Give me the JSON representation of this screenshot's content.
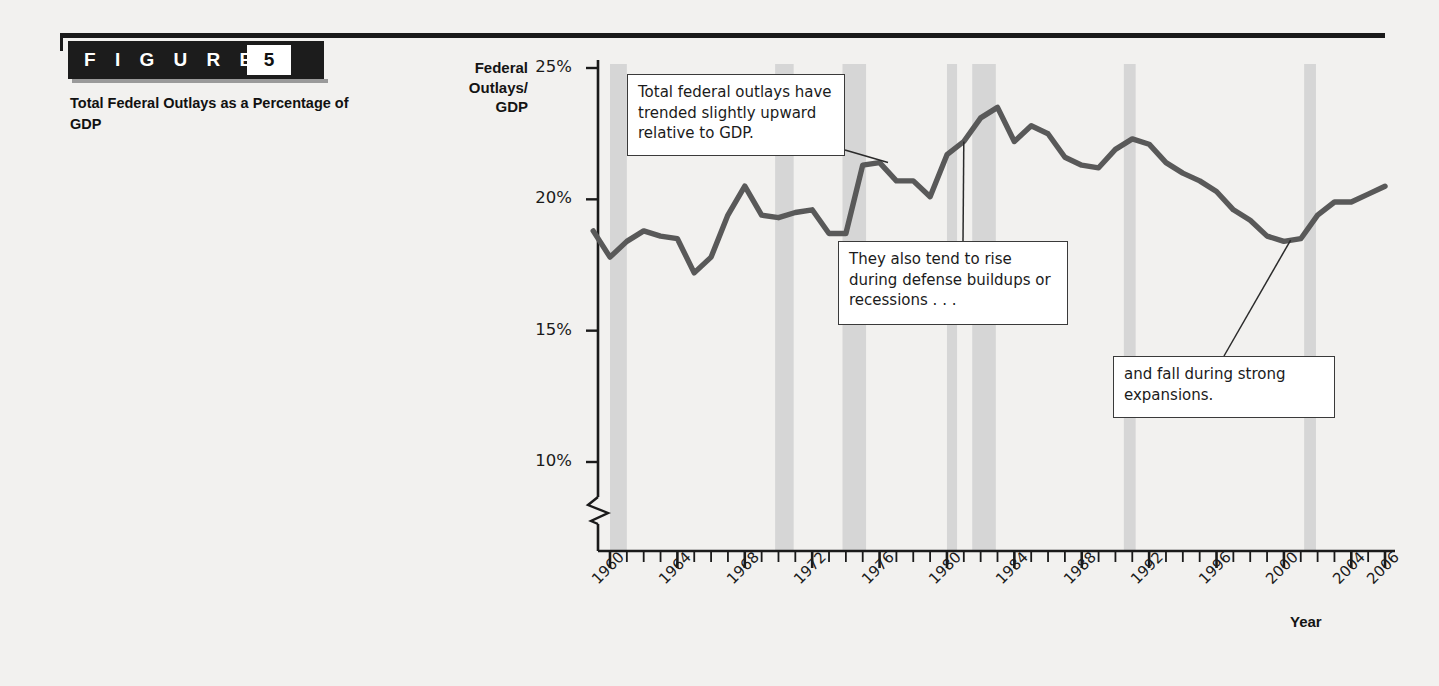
{
  "figure": {
    "word": "F I G U R E",
    "number": "5",
    "caption": "Total Federal Outlays as a Percentage of GDP"
  },
  "chart_data": {
    "type": "line",
    "title": "Total Federal Outlays as a Percentage of GDP",
    "xlabel": "Year",
    "ylabel": "Federal Outlays/ GDP",
    "ylabel_lines": [
      "Federal",
      "Outlays/",
      "GDP"
    ],
    "xlim": [
      1959,
      2007
    ],
    "ylim": [
      9,
      25
    ],
    "y_axis_break": true,
    "grid": false,
    "legend": "none",
    "line_color": "#595959",
    "recession_band_color": "#d6d6d6",
    "yticks": [
      10,
      15,
      20,
      25
    ],
    "ytick_labels": [
      "10%",
      "15%",
      "20%",
      "25%"
    ],
    "xticks": [
      1960,
      1964,
      1968,
      1972,
      1976,
      1980,
      1984,
      1988,
      1992,
      1996,
      2000,
      2004,
      2006
    ],
    "xtick_labels": [
      "1960",
      "1964",
      "1968",
      "1972",
      "1976",
      "1980",
      "1984",
      "1988",
      "1992",
      "1996",
      "2000",
      "2004",
      "2006"
    ],
    "x": [
      1959,
      1960,
      1961,
      1962,
      1963,
      1964,
      1965,
      1966,
      1967,
      1968,
      1969,
      1970,
      1971,
      1972,
      1973,
      1974,
      1975,
      1976,
      1977,
      1978,
      1979,
      1980,
      1981,
      1982,
      1983,
      1984,
      1985,
      1986,
      1987,
      1988,
      1989,
      1990,
      1991,
      1992,
      1993,
      1994,
      1995,
      1996,
      1997,
      1998,
      1999,
      2000,
      2001,
      2002,
      2003,
      2004,
      2005,
      2006
    ],
    "values": [
      18.8,
      17.8,
      18.4,
      18.8,
      18.6,
      18.5,
      17.2,
      17.8,
      19.4,
      20.5,
      19.4,
      19.3,
      19.5,
      19.6,
      18.7,
      18.7,
      21.3,
      21.4,
      20.7,
      20.7,
      20.1,
      21.7,
      22.2,
      23.1,
      23.5,
      22.2,
      22.8,
      22.5,
      21.6,
      21.3,
      21.2,
      21.9,
      22.3,
      22.1,
      21.4,
      21.0,
      20.7,
      20.3,
      19.6,
      19.2,
      18.6,
      18.4,
      18.5,
      19.4,
      19.9,
      19.9,
      20.2,
      20.5
    ],
    "recession_bands": [
      {
        "start": 1960.0,
        "end": 1961.0
      },
      {
        "start": 1969.8,
        "end": 1970.9
      },
      {
        "start": 1973.8,
        "end": 1975.2
      },
      {
        "start": 1980.0,
        "end": 1980.6
      },
      {
        "start": 1981.5,
        "end": 1982.9
      },
      {
        "start": 1990.5,
        "end": 1991.2
      },
      {
        "start": 2001.2,
        "end": 2001.9
      }
    ],
    "annotations": [
      {
        "text": "Total federal outlays have trended slightly upward relative to GDP.",
        "target_x": 1976.5,
        "target_y": 21.4
      },
      {
        "text": "They also tend to rise during defense buildups or recessions . . .",
        "target_x": 1981.0,
        "target_y": 22.2
      },
      {
        "text": "and fall during strong expansions.",
        "target_x": 2000.5,
        "target_y": 18.4
      }
    ]
  }
}
